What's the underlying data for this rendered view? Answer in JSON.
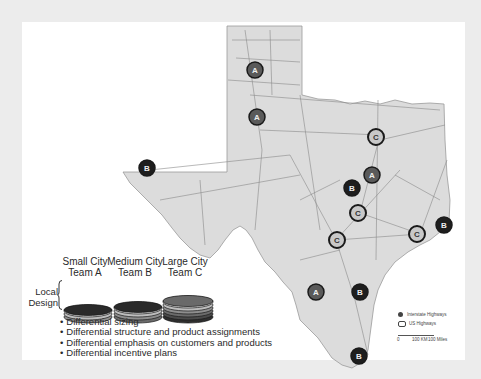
{
  "map": {
    "region": "Texas",
    "legend": {
      "interstate_label": "Interstate Highways",
      "us_label": "US Highways",
      "scale_zero": "0",
      "scale_km": "100 KM",
      "scale_miles": "100 Miles"
    },
    "markers": [
      {
        "team": "A",
        "style": "A"
      },
      {
        "team": "A",
        "style": "A"
      },
      {
        "team": "B",
        "style": "B"
      },
      {
        "team": "C",
        "style": "C"
      },
      {
        "team": "A",
        "style": "A"
      },
      {
        "team": "B",
        "style": "B"
      },
      {
        "team": "C",
        "style": "C"
      },
      {
        "team": "C",
        "style": "C"
      },
      {
        "team": "C",
        "style": "C"
      },
      {
        "team": "B",
        "style": "B"
      },
      {
        "team": "A",
        "style": "A"
      },
      {
        "team": "B",
        "style": "B"
      },
      {
        "team": "B",
        "style": "B"
      }
    ],
    "colors": {
      "land": "#dcdcdc",
      "road": "#8a8a8a",
      "marker_a_fill": "#5a5a5a",
      "marker_b_fill": "#1e1e1e",
      "marker_c_fill": "#c8c8c8",
      "marker_ring": "#1a1a1a"
    }
  },
  "teams": [
    {
      "line1": "Small City",
      "line2": "Team A",
      "discs": 3
    },
    {
      "line1": "Medium City",
      "line2": "Team B",
      "discs": 4
    },
    {
      "line1": "Large City",
      "line2": "Team C",
      "discs": 6
    }
  ],
  "local_design": {
    "line1": "Local",
    "line2": "Design"
  },
  "bullets": [
    "Differential sizing",
    "Differential structure and product assignments",
    "Differential emphasis on customers and products",
    "Differential incentive plans"
  ]
}
